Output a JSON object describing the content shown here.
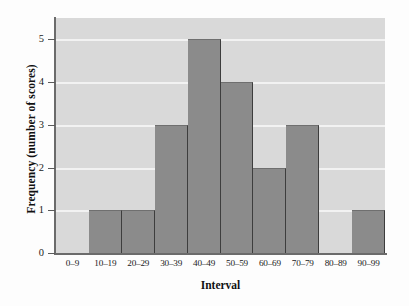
{
  "chart_data": {
    "type": "bar",
    "title": "",
    "subtitle": "",
    "xlabel": "Interval",
    "ylabel": "Frequency (number of scores)",
    "categories": [
      "0–9",
      "10–19",
      "20–29",
      "30–39",
      "40–49",
      "50–59",
      "60–69",
      "70–79",
      "80–89",
      "90–99"
    ],
    "values": [
      0,
      1,
      1,
      3,
      5,
      4,
      2,
      3,
      0,
      1
    ],
    "ylim": [
      0,
      5.5
    ],
    "yticks": [
      "0",
      "1",
      "2",
      "3",
      "4",
      "5"
    ],
    "ytick_values": [
      0,
      1,
      2,
      3,
      4,
      5
    ],
    "grid": "horizontal",
    "legend": "none",
    "colors": {
      "bar_fill": "#8b8b8b",
      "bar_edge": "#3d3d3d",
      "plot_background": "#d9d9d9",
      "gridline": "#f2f2f2",
      "axis": "#6b6b6b",
      "text": "#1a1a1a",
      "figure_background": "#fdfdfd"
    }
  }
}
